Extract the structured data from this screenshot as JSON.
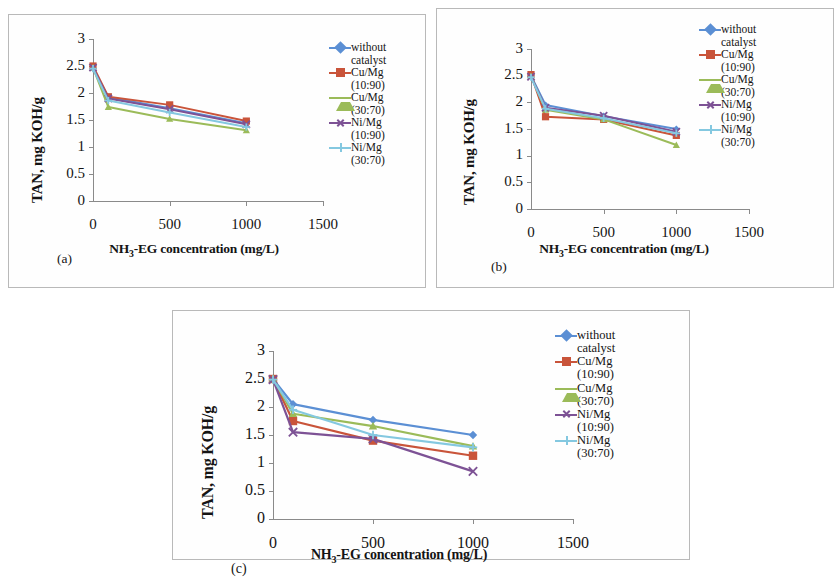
{
  "figure": {
    "panels": [
      {
        "tag": "(a)",
        "xlabel_main": "NH",
        "xlabel_sub": "3",
        "xlabel_rest": "-EG concentration (mg/L)",
        "ylabel": "TAN, mg KOH/g"
      },
      {
        "tag": "(b)",
        "xlabel_main": "NH",
        "xlabel_sub": "3",
        "xlabel_rest": "-EG concentration (mg/L)",
        "ylabel": "TAN, mg KOH/g"
      },
      {
        "tag": "(c)",
        "xlabel_main": "NH",
        "xlabel_sub": "3",
        "xlabel_rest": "-EG concentration (mg/L)",
        "ylabel": "TAN, mg KOH/g"
      }
    ],
    "legend": [
      {
        "name": "without",
        "sub": "catalyst",
        "color": "#5b8fd4",
        "marker": "diamond"
      },
      {
        "name": "Cu/Mg",
        "sub": "(10:90)",
        "color": "#c9543a",
        "marker": "square"
      },
      {
        "name": "Cu/Mg",
        "sub": "(30:70)",
        "color": "#9bbb59",
        "marker": "triangle"
      },
      {
        "name": "Ni/Mg",
        "sub": "(10:90)",
        "color": "#7d5295",
        "marker": "cross"
      },
      {
        "name": "Ni/Mg",
        "sub": "(30:70)",
        "color": "#84c8e0",
        "marker": "plus"
      }
    ],
    "ytick_labels": [
      "3",
      "2.5",
      "2",
      "1.5",
      "1",
      "0.5",
      "0"
    ],
    "xtick_labels": [
      "0",
      "500",
      "1000",
      "1500"
    ]
  },
  "chart_data": [
    {
      "type": "line",
      "panel": "(a)",
      "title": "",
      "xlabel": "NH3-EG concentration (mg/L)",
      "ylabel": "TAN, mg KOH/g",
      "xlim": [
        0,
        1500
      ],
      "ylim": [
        0,
        3
      ],
      "xticks": [
        0,
        500,
        1000,
        1500
      ],
      "yticks": [
        0,
        0.5,
        1,
        1.5,
        2,
        2.5,
        3
      ],
      "grid": false,
      "legend_position": "right",
      "x": [
        0,
        100,
        500,
        1000
      ],
      "series": [
        {
          "name": "without catalyst",
          "color": "#5b8fd4",
          "marker": "diamond",
          "values": [
            2.46,
            1.92,
            1.72,
            1.44
          ]
        },
        {
          "name": "Cu/Mg (10:90)",
          "color": "#c9543a",
          "marker": "square",
          "values": [
            2.5,
            1.93,
            1.78,
            1.48
          ]
        },
        {
          "name": "Cu/Mg (30:70)",
          "color": "#9bbb59",
          "marker": "triangle",
          "values": [
            2.47,
            1.74,
            1.52,
            1.31
          ]
        },
        {
          "name": "Ni/Mg (10:90)",
          "color": "#7d5295",
          "marker": "cross",
          "values": [
            2.47,
            1.9,
            1.7,
            1.42
          ]
        },
        {
          "name": "Ni/Mg (30:70)",
          "color": "#84c8e0",
          "marker": "plus",
          "values": [
            2.45,
            1.86,
            1.64,
            1.37
          ]
        }
      ]
    },
    {
      "type": "line",
      "panel": "(b)",
      "title": "",
      "xlabel": "NH3-EG concentration (mg/L)",
      "ylabel": "TAN, mg KOH/g",
      "xlim": [
        0,
        1500
      ],
      "ylim": [
        0,
        3
      ],
      "xticks": [
        0,
        500,
        1000,
        1500
      ],
      "yticks": [
        0,
        0.5,
        1,
        1.5,
        2,
        2.5,
        3
      ],
      "grid": false,
      "legend_position": "right",
      "x": [
        0,
        100,
        500,
        1000
      ],
      "series": [
        {
          "name": "without catalyst",
          "color": "#5b8fd4",
          "marker": "diamond",
          "values": [
            2.5,
            1.95,
            1.74,
            1.5
          ]
        },
        {
          "name": "Cu/Mg (10:90)",
          "color": "#c9543a",
          "marker": "square",
          "values": [
            2.52,
            1.73,
            1.68,
            1.38
          ]
        },
        {
          "name": "Cu/Mg (30:70)",
          "color": "#9bbb59",
          "marker": "triangle",
          "values": [
            2.49,
            1.86,
            1.68,
            1.2
          ]
        },
        {
          "name": "Ni/Mg (10:90)",
          "color": "#7d5295",
          "marker": "cross",
          "values": [
            2.48,
            1.9,
            1.75,
            1.45
          ]
        },
        {
          "name": "Ni/Mg (30:70)",
          "color": "#84c8e0",
          "marker": "plus",
          "values": [
            2.47,
            1.88,
            1.7,
            1.42
          ]
        }
      ]
    },
    {
      "type": "line",
      "panel": "(c)",
      "title": "",
      "xlabel": "NH3-EG concentration (mg/L)",
      "ylabel": "TAN, mg KOH/g",
      "xlim": [
        0,
        1500
      ],
      "ylim": [
        0,
        3
      ],
      "xticks": [
        0,
        500,
        1000,
        1500
      ],
      "yticks": [
        0,
        0.5,
        1,
        1.5,
        2,
        2.5,
        3
      ],
      "grid": false,
      "legend_position": "right",
      "x": [
        0,
        100,
        500,
        1000
      ],
      "series": [
        {
          "name": "without catalyst",
          "color": "#5b8fd4",
          "marker": "diamond",
          "values": [
            2.5,
            2.05,
            1.77,
            1.5
          ]
        },
        {
          "name": "Cu/Mg (10:90)",
          "color": "#c9543a",
          "marker": "square",
          "values": [
            2.5,
            1.75,
            1.4,
            1.13
          ]
        },
        {
          "name": "Cu/Mg (30:70)",
          "color": "#9bbb59",
          "marker": "triangle",
          "values": [
            2.5,
            1.88,
            1.66,
            1.3
          ]
        },
        {
          "name": "Ni/Mg (10:90)",
          "color": "#7d5295",
          "marker": "cross",
          "values": [
            2.49,
            1.55,
            1.43,
            0.85
          ]
        },
        {
          "name": "Ni/Mg (30:70)",
          "color": "#84c8e0",
          "marker": "plus",
          "values": [
            2.49,
            1.95,
            1.5,
            1.28
          ]
        }
      ]
    }
  ]
}
